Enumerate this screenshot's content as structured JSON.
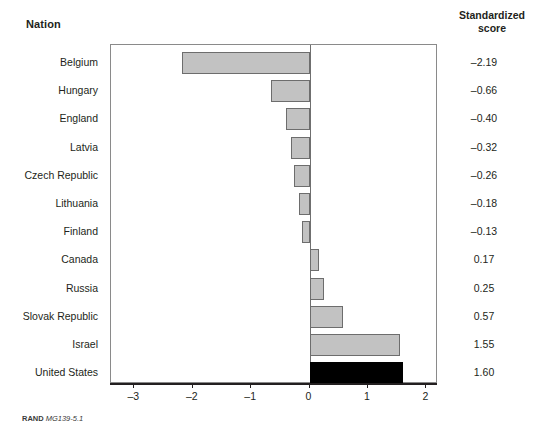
{
  "headers": {
    "nation": "Nation",
    "score_line1": "Standardized",
    "score_line2": "score"
  },
  "footer": {
    "source": "RAND",
    "figure_code": "MG139-5.1"
  },
  "colors": {
    "bar_fill": "#c2c2c2",
    "bar_border": "#6d6d6d",
    "highlight_fill": "#000000",
    "frame": "#8a8a8a",
    "text": "#231f20"
  },
  "chart_data": {
    "type": "bar",
    "orientation": "horizontal",
    "title": "",
    "xlabel": "",
    "ylabel": "Nation",
    "value_label": "Standardized score",
    "xlim": [
      -3.4,
      2.2
    ],
    "xticks": [
      -3,
      -2,
      -1,
      0,
      1,
      2
    ],
    "xticklabels": [
      "–3",
      "–2",
      "–1",
      "0",
      "1",
      "2"
    ],
    "grid": false,
    "legend": false,
    "zero_reference_line": true,
    "categories": [
      "Belgium",
      "Hungary",
      "England",
      "Latvia",
      "Czech Republic",
      "Lithuania",
      "Finland",
      "Canada",
      "Russia",
      "Slovak Republic",
      "Israel",
      "United States"
    ],
    "values": [
      -2.19,
      -0.66,
      -0.4,
      -0.32,
      -0.26,
      -0.18,
      -0.13,
      0.17,
      0.25,
      0.57,
      1.55,
      1.6
    ],
    "value_labels": [
      "–2.19",
      "–0.66",
      "–0.40",
      "–0.32",
      "–0.26",
      "–0.18",
      "–0.13",
      "0.17",
      "0.25",
      "0.57",
      "1.55",
      "1.60"
    ],
    "highlighted": [
      "United States"
    ]
  }
}
